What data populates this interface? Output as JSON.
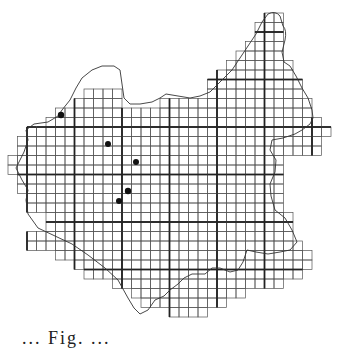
{
  "figure": {
    "type": "grid distribution map",
    "caption_fragment": "... Fig. ...",
    "colors": {
      "background": "#ffffff",
      "grid_line": "#555555",
      "major_line": "#222222",
      "boundary": "#333333",
      "dot": "#111111"
    },
    "grid": {
      "origin_x": 8,
      "origin_y": 13,
      "cell": 9.5,
      "major_every": 5,
      "major_col_offset": 2,
      "major_row_offset": 2,
      "rows": [
        [
          27,
          28
        ],
        [
          26,
          28
        ],
        [
          26,
          28
        ],
        [
          25,
          28
        ],
        [
          24,
          28
        ],
        [
          23,
          29
        ],
        [
          22,
          29
        ],
        [
          21,
          30
        ],
        [
          8,
          11,
          21,
          30
        ],
        [
          7,
          11,
          16,
          31
        ],
        [
          5,
          31
        ],
        [
          4,
          32
        ],
        [
          2,
          33
        ],
        [
          1,
          32
        ],
        [
          1,
          32
        ],
        [
          0,
          28
        ],
        [
          0,
          28
        ],
        [
          1,
          28
        ],
        [
          1,
          28
        ],
        [
          2,
          28
        ],
        [
          2,
          28
        ],
        [
          4,
          29
        ],
        [
          4,
          29
        ],
        [
          2,
          29
        ],
        [
          2,
          30
        ],
        [
          5,
          31
        ],
        [
          7,
          31
        ],
        [
          8,
          30
        ],
        [
          11,
          28
        ],
        [
          13,
          24
        ],
        [
          14,
          22
        ],
        [
          17,
          20
        ]
      ]
    },
    "dots": [
      {
        "x": 61,
        "y": 115,
        "r": 3.2
      },
      {
        "x": 108,
        "y": 144,
        "r": 3
      },
      {
        "x": 136,
        "y": 162,
        "r": 3
      },
      {
        "x": 128,
        "y": 191,
        "r": 3.2
      },
      {
        "x": 119,
        "y": 201,
        "r": 3
      }
    ]
  }
}
